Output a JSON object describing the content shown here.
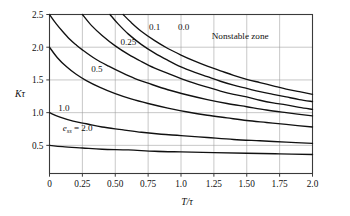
{
  "chart_data": {
    "type": "line",
    "title": "",
    "xlabel": "T/τ",
    "ylabel": "Kτ",
    "xlim": [
      0,
      2.0
    ],
    "ylim": [
      0.07,
      2.5
    ],
    "grid": true,
    "legend": "inline-curve-labels",
    "xticks": [
      "0",
      "0.25",
      "0.50",
      "0.75",
      "1.0",
      "1.25",
      "1.50",
      "1.75",
      "2.0"
    ],
    "xtick_values": [
      0,
      0.25,
      0.5,
      0.75,
      1.0,
      1.25,
      1.5,
      1.75,
      2.0
    ],
    "yticks": [
      "0.5",
      "1.0",
      "1.5",
      "2.0",
      "2.5"
    ],
    "ytick_values": [
      0.5,
      1.0,
      1.5,
      2.0,
      2.5
    ],
    "annotations": [
      {
        "text": "Nonstable zone",
        "x": 1.45,
        "y": 2.12
      },
      {
        "text": "e_ss = 2.0",
        "x": 0.1,
        "y": 0.72
      }
    ],
    "series": [
      {
        "name": "0.0",
        "label": "0.0",
        "label_x": 1.02,
        "label_y": 2.26,
        "x": [
          0.56,
          0.62,
          0.7,
          0.8,
          0.9,
          1.0,
          1.1,
          1.2,
          1.3,
          1.4,
          1.5,
          1.6,
          1.7,
          1.8,
          1.9,
          2.0
        ],
        "y": [
          2.5,
          2.38,
          2.24,
          2.1,
          1.98,
          1.88,
          1.79,
          1.71,
          1.64,
          1.57,
          1.51,
          1.46,
          1.41,
          1.36,
          1.32,
          1.28
        ]
      },
      {
        "name": "0.1",
        "label": "0.1",
        "label_x": 0.8,
        "label_y": 2.26,
        "x": [
          0.46,
          0.52,
          0.6,
          0.7,
          0.8,
          0.9,
          1.0,
          1.1,
          1.2,
          1.3,
          1.4,
          1.5,
          1.6,
          1.7,
          1.8,
          1.9,
          2.0
        ],
        "y": [
          2.5,
          2.36,
          2.2,
          2.04,
          1.91,
          1.8,
          1.7,
          1.62,
          1.55,
          1.48,
          1.42,
          1.37,
          1.32,
          1.28,
          1.24,
          1.2,
          1.17
        ]
      },
      {
        "name": "0.25",
        "label": "0.25",
        "label_x": 0.6,
        "label_y": 2.03,
        "x": [
          0.25,
          0.32,
          0.4,
          0.5,
          0.6,
          0.7,
          0.8,
          0.9,
          1.0,
          1.1,
          1.2,
          1.3,
          1.4,
          1.5,
          1.6,
          1.7,
          1.8,
          1.9,
          2.0
        ],
        "y": [
          2.5,
          2.33,
          2.18,
          2.02,
          1.89,
          1.78,
          1.68,
          1.6,
          1.52,
          1.45,
          1.39,
          1.33,
          1.28,
          1.24,
          1.19,
          1.15,
          1.12,
          1.08,
          1.05
        ]
      },
      {
        "name": "0.5",
        "label": "0.5",
        "label_x": 0.36,
        "label_y": 1.62,
        "x": [
          0.0,
          0.05,
          0.1,
          0.15,
          0.2,
          0.25,
          0.35,
          0.45,
          0.55,
          0.65,
          0.75,
          0.9,
          1.05,
          1.2,
          1.35,
          1.5,
          1.65,
          1.8,
          2.0
        ],
        "y": [
          2.5,
          2.36,
          2.24,
          2.13,
          2.04,
          1.96,
          1.82,
          1.71,
          1.61,
          1.52,
          1.45,
          1.35,
          1.27,
          1.2,
          1.14,
          1.09,
          1.04,
          1.0,
          0.95
        ]
      },
      {
        "name": "1.0",
        "label": "1.0",
        "label_x": 0.11,
        "label_y": 1.02,
        "x": [
          0.0,
          0.06,
          0.13,
          0.2,
          0.28,
          0.38,
          0.5,
          0.62,
          0.75,
          0.9,
          1.05,
          1.2,
          1.35,
          1.5,
          1.65,
          1.8,
          2.0
        ],
        "y": [
          2.0,
          1.84,
          1.7,
          1.59,
          1.49,
          1.39,
          1.29,
          1.21,
          1.14,
          1.07,
          1.01,
          0.96,
          0.92,
          0.88,
          0.85,
          0.82,
          0.78
        ]
      },
      {
        "name": "2.0-upper",
        "label": "",
        "label_x": 0,
        "label_y": 0,
        "x": [
          0.0,
          0.08,
          0.18,
          0.28,
          0.4,
          0.55,
          0.7,
          0.85,
          1.0,
          1.2,
          1.4,
          1.6,
          1.8,
          2.0
        ],
        "y": [
          1.0,
          0.93,
          0.87,
          0.83,
          0.78,
          0.74,
          0.7,
          0.67,
          0.65,
          0.62,
          0.59,
          0.57,
          0.55,
          0.53
        ]
      },
      {
        "name": "2.0",
        "label": "",
        "label_x": 0,
        "label_y": 0,
        "x": [
          0.0,
          0.1,
          0.25,
          0.4,
          0.6,
          0.8,
          1.0,
          1.25,
          1.5,
          1.75,
          2.0
        ],
        "y": [
          0.5,
          0.48,
          0.46,
          0.44,
          0.43,
          0.41,
          0.4,
          0.39,
          0.38,
          0.37,
          0.36
        ]
      }
    ]
  },
  "labels": {
    "nonstable_zone": "Nonstable zone",
    "ess_prefix": "e",
    "ess_sub": "ss",
    "ess_value": "= 2.0",
    "x_axis_title": "T/τ",
    "y_axis_title": "Kτ"
  },
  "colors": {
    "curve": "#111111",
    "grid": "#9a9a9a",
    "frame": "#3a3a3a",
    "text": "#101010",
    "background": "#ffffff"
  }
}
